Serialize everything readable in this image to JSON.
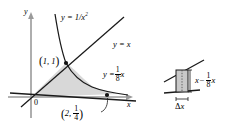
{
  "figure": {
    "background_color": "#ffffff",
    "ink_color": "#000000",
    "shade_color": "#d8d8d8",
    "axis_color": "#8c8c8c"
  },
  "left_panel": {
    "axes": {
      "y_axis_label": "y",
      "x_axis_label": "x",
      "origin_label": "0"
    },
    "curves": [
      {
        "name": "reciprocal-square-curve",
        "label_y": "y = 1/x",
        "label_exp": "2"
      },
      {
        "name": "identity-line",
        "label": "y = x"
      },
      {
        "name": "eighth-line",
        "label_lhs": "y =",
        "label_num": "1",
        "label_den": "8",
        "label_var": "x"
      }
    ],
    "points": [
      {
        "name": "intersection-point-1-1",
        "label_open": "(",
        "label_x": "1, ",
        "label_y": "1",
        "label_close": ")"
      },
      {
        "name": "intersection-point-2-quarter",
        "label_open": "(",
        "label_x": "2, ",
        "label_num": "1",
        "label_den": "4",
        "label_close": ")"
      }
    ]
  },
  "right_panel": {
    "height_label": {
      "var1": "x",
      "minus": "−",
      "num": "1",
      "den": "8",
      "var2": "x"
    },
    "width_label": {
      "delta": "Δ",
      "var": "x"
    },
    "strip_name": "representative-rectangle"
  }
}
